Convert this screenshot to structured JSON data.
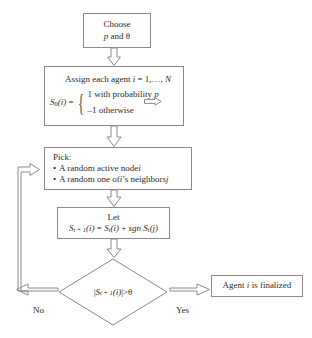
{
  "diagram": {
    "type": "flowchart",
    "background_color": "#ffffff",
    "stroke_color": "#8a8a8a",
    "text_color": "#2b2b2b"
  },
  "nodes": {
    "choose": {
      "shape": "rectangle",
      "line1": "Choose",
      "line2_prefix": "p",
      "line2_mid": " and ",
      "line2_suffix": "θ"
    },
    "assign": {
      "shape": "rectangle",
      "header_prefix": "Assign each agent ",
      "header_var": "i",
      "header_eq": " = 1,…, ",
      "header_n": "N",
      "lhs_s": "S",
      "lhs_sub": "0",
      "lhs_arg": "(i)",
      "lhs_eq": " =",
      "case1": "1 with probability ",
      "case1_var": "p",
      "case2": "–1 otherwise",
      "inline_glyph": "right-arrow-glyph"
    },
    "pick": {
      "shape": "rectangle",
      "header": "Pick:",
      "bullets": [
        {
          "dot": "•",
          "text_before": "A random active node ",
          "var": "i",
          "text_after": ""
        },
        {
          "dot": "•",
          "text_before": "A random one of ",
          "var": "i",
          "text_after": "’s neighbors ",
          "var2": "j"
        }
      ]
    },
    "let": {
      "shape": "rectangle",
      "line1": "Let",
      "f_s1": "S",
      "f_sub1": "t + 1",
      "f_arg1": "(i)",
      "f_eq": " = ",
      "f_s2": "S",
      "f_sub2": "t",
      "f_arg2": "(i)",
      "f_plus": " + ",
      "f_sgn": "sgn",
      "f_s3": " S",
      "f_sub3": "t",
      "f_arg3": "(j)"
    },
    "decision": {
      "shape": "diamond",
      "abs_open": "|",
      "d_s": "S",
      "d_sub": "t + 1",
      "d_arg": "(i)",
      "abs_close": "|",
      "d_op": " > ",
      "d_theta": "θ"
    },
    "final": {
      "shape": "rectangle",
      "text_before": "Agent ",
      "var": "i",
      "text_after": " is finalized"
    }
  },
  "edges": {
    "choose_to_assign": {
      "style": "hollow-arrow",
      "direction": "down",
      "label": ""
    },
    "assign_to_pick": {
      "style": "hollow-arrow",
      "direction": "down",
      "label": ""
    },
    "pick_to_let": {
      "style": "hollow-arrow",
      "direction": "down",
      "label": ""
    },
    "let_to_decision": {
      "style": "hollow-arrow",
      "direction": "down",
      "label": ""
    },
    "decision_no": {
      "style": "hollow-arrow",
      "direction": "left-up-right",
      "label": "No"
    },
    "decision_yes": {
      "style": "hollow-arrow",
      "direction": "right",
      "label": "Yes"
    }
  }
}
